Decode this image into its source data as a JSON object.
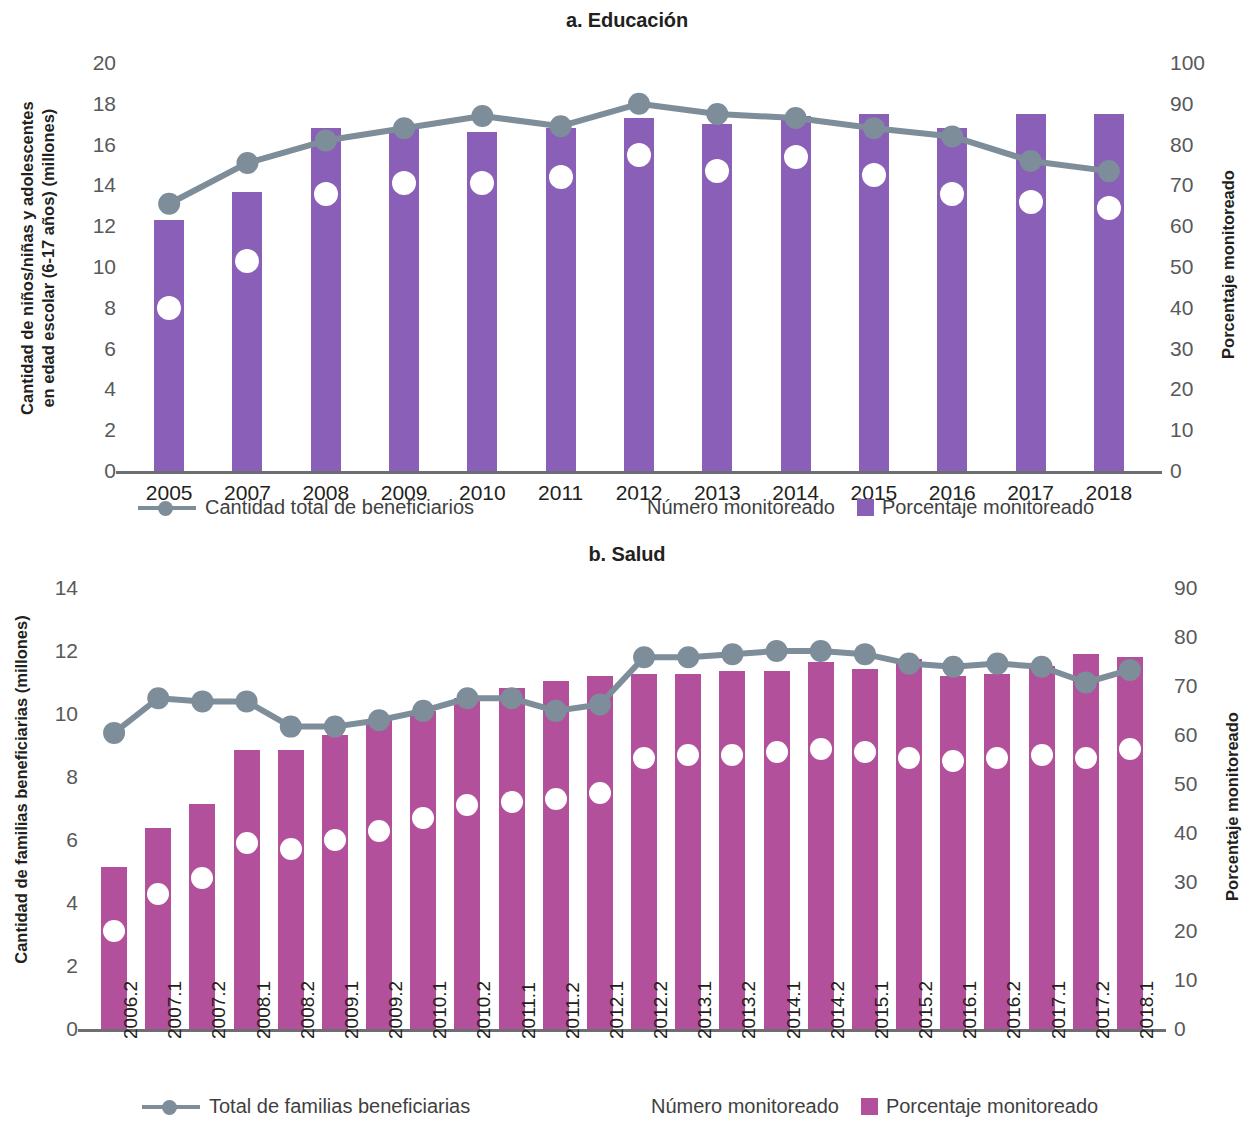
{
  "chart_data": [
    {
      "type": "bar",
      "panel_id": "a",
      "title": "a. Educación",
      "ylabel": "Cantidad de niños/niñas y adolescentes\nen edad escolar (6-17 años) (millones)",
      "ylabel_right": "Porcentaje monitoreado",
      "xlabel": "",
      "ylim": [
        0,
        20
      ],
      "ylim_right": [
        0,
        100
      ],
      "yticks": [
        0,
        2,
        4,
        6,
        8,
        10,
        12,
        14,
        16,
        18,
        20
      ],
      "yticks_right": [
        0,
        10,
        20,
        30,
        40,
        50,
        60,
        70,
        80,
        90,
        100
      ],
      "grid": false,
      "legend_position": "bottom",
      "categories": [
        "2005",
        "2007",
        "2008",
        "2009",
        "2010",
        "2011",
        "2012",
        "2013",
        "2014",
        "2015",
        "2016",
        "2017",
        "2018"
      ],
      "series": [
        {
          "name": "Porcentaje monitoreado",
          "render": "bar",
          "axis": "right",
          "color": "#8a5fb8",
          "values": [
            61.5,
            68.5,
            84.0,
            84.0,
            83.0,
            84.0,
            86.5,
            85.0,
            87.0,
            87.5,
            84.0,
            87.5,
            87.5
          ]
        },
        {
          "name": "Número monitoreado",
          "render": "marker",
          "axis": "left",
          "color": "#ffffff",
          "values": [
            8.0,
            10.3,
            13.6,
            14.1,
            14.1,
            14.4,
            15.5,
            14.7,
            15.4,
            14.5,
            13.6,
            13.2,
            12.9
          ]
        },
        {
          "name": "Cantidad total de beneficiarios",
          "render": "line",
          "axis": "left",
          "color": "#7d8d99",
          "values": [
            13.1,
            15.1,
            16.2,
            16.8,
            17.4,
            16.9,
            18.0,
            17.5,
            17.3,
            16.8,
            16.4,
            15.2,
            14.7
          ]
        }
      ],
      "legend": [
        {
          "label": "Cantidad total de beneficiarios",
          "marker": "line"
        },
        {
          "label": "Número monitoreado",
          "marker": "white-dot"
        },
        {
          "label": "Porcentaje monitoreado",
          "marker": "square",
          "color": "#8a5fb8"
        }
      ]
    },
    {
      "type": "bar",
      "panel_id": "b",
      "title": "b. Salud",
      "ylabel": "Cantidad de familias beneficiarias (millones)",
      "ylabel_right": "Porcentaje monitoreado",
      "xlabel": "",
      "ylim": [
        0,
        14
      ],
      "ylim_right": [
        0,
        90
      ],
      "yticks": [
        0,
        2,
        4,
        6,
        8,
        10,
        12,
        14
      ],
      "yticks_right": [
        0,
        10,
        20,
        30,
        40,
        50,
        60,
        70,
        80,
        90
      ],
      "grid": false,
      "legend_position": "bottom",
      "categories": [
        "2006.2",
        "2007.1",
        "2007.2",
        "2008.1",
        "2008.2",
        "2009.1",
        "2009.2",
        "2010.1",
        "2010.2",
        "2011.1",
        "2011.2",
        "2012.1",
        "2012.2",
        "2013.1",
        "2013.2",
        "2014.1",
        "2014.2",
        "2015.1",
        "2015.2",
        "2016.1",
        "2016.2",
        "2017.1",
        "2017.2",
        "2018.1"
      ],
      "series": [
        {
          "name": "Porcentaje monitoreado",
          "render": "bar",
          "axis": "right",
          "color": "#b3509b",
          "values": [
            33.0,
            41.0,
            46.0,
            57.0,
            57.0,
            60.0,
            63.0,
            65.0,
            67.5,
            69.5,
            71.0,
            72.0,
            72.5,
            72.5,
            73.0,
            73.0,
            75.0,
            73.5,
            75.5,
            72.0,
            72.5,
            74.0,
            76.5,
            76.0
          ]
        },
        {
          "name": "Número monitoreado",
          "render": "marker",
          "axis": "left",
          "color": "#ffffff",
          "values": [
            3.1,
            4.3,
            4.8,
            5.9,
            5.7,
            6.0,
            6.3,
            6.7,
            7.1,
            7.2,
            7.3,
            7.5,
            8.6,
            8.7,
            8.7,
            8.8,
            8.9,
            8.8,
            8.6,
            8.5,
            8.6,
            8.7,
            8.6,
            8.9
          ]
        },
        {
          "name": "Total de familias beneficiarias",
          "render": "line",
          "axis": "left",
          "color": "#7d8d99",
          "values": [
            9.4,
            10.5,
            10.4,
            10.4,
            9.6,
            9.6,
            9.8,
            10.1,
            10.5,
            10.5,
            10.1,
            10.3,
            11.8,
            11.8,
            11.9,
            12.0,
            12.0,
            11.9,
            11.6,
            11.5,
            11.6,
            11.5,
            11.0,
            11.4
          ]
        }
      ],
      "legend": [
        {
          "label": "Total de familias beneficiarias",
          "marker": "line"
        },
        {
          "label": "Número monitoreado",
          "marker": "white-dot"
        },
        {
          "label": "Porcentaje monitoreado",
          "marker": "square",
          "color": "#b3509b"
        }
      ]
    }
  ],
  "colors": {
    "bar_education": "#8a5fb8",
    "bar_health": "#b3509b",
    "line": "#7d8d99",
    "marker_monitored": "#ffffff",
    "axis": "#6d6e71",
    "tick_text": "#58595b",
    "title_text": "#231f20"
  }
}
